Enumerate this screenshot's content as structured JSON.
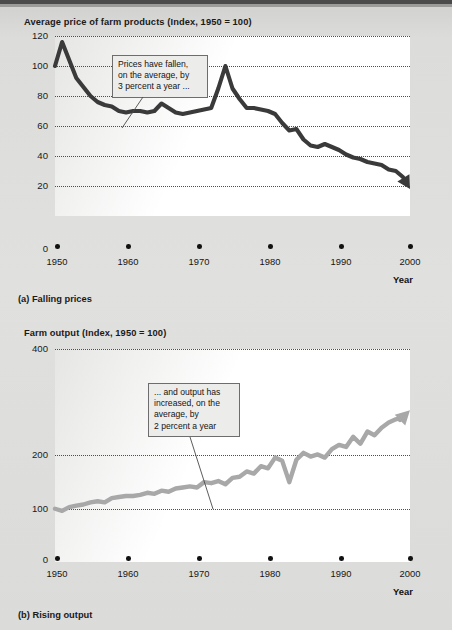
{
  "page": {
    "background_color": "#dcdcda",
    "figure_label": "Figure: Falling prices and rising output in U.S. agriculture"
  },
  "chart_a": {
    "title": "Average price of farm products (Index, 1950 = 100)",
    "caption": "(a) Falling prices",
    "x_axis_name": "Year",
    "callout_text": "Prices have fallen,\non the average, by\n3 percent a year ...",
    "line_color": "#3a3a3a",
    "y_ticks": [
      "120",
      "100",
      "80",
      "60",
      "40",
      "20",
      "0"
    ],
    "x_ticks": [
      "1950",
      "1960",
      "1970",
      "1980",
      "1990",
      "2000"
    ]
  },
  "chart_b": {
    "title": "Farm output (Index, 1950 = 100)",
    "caption": "(b) Rising output",
    "x_axis_name": "Year",
    "callout_text": "... and output has\nincreased, on the\naverage, by\n2 percent a year",
    "line_color": "#a8a8a8",
    "y_ticks": [
      "400",
      "200",
      "100",
      "0"
    ],
    "x_ticks": [
      "1950",
      "1960",
      "1970",
      "1980",
      "1990",
      "2000"
    ]
  },
  "chart_data": [
    {
      "type": "line",
      "title": "Average price of farm products (Index, 1950 = 100)",
      "subtitle": "(a) Falling prices",
      "xlabel": "Year",
      "ylabel": "Index, 1950 = 100",
      "xlim": [
        1950,
        2000
      ],
      "ylim": [
        0,
        120
      ],
      "ytick_values": [
        0,
        20,
        40,
        60,
        80,
        100,
        120
      ],
      "xtick_values": [
        1950,
        1960,
        1970,
        1980,
        1990,
        2000
      ],
      "grid": "horizontal-dotted",
      "legend": "none",
      "annotation": "Prices have fallen, on the average, by 3 percent a year ...",
      "series": [
        {
          "name": "Average price of farm products",
          "x": [
            1950,
            1951,
            1952,
            1953,
            1954,
            1955,
            1956,
            1957,
            1958,
            1959,
            1960,
            1961,
            1962,
            1963,
            1964,
            1965,
            1966,
            1967,
            1968,
            1969,
            1970,
            1971,
            1972,
            1973,
            1974,
            1975,
            1976,
            1977,
            1978,
            1979,
            1980,
            1981,
            1982,
            1983,
            1984,
            1985,
            1986,
            1987,
            1988,
            1989,
            1990,
            1991,
            1992,
            1993,
            1994,
            1995,
            1996,
            1997,
            1998,
            1999,
            2000
          ],
          "values": [
            100,
            116,
            104,
            92,
            86,
            80,
            76,
            74,
            73,
            70,
            69,
            70,
            70,
            69,
            70,
            75,
            72,
            69,
            68,
            69,
            70,
            71,
            72,
            85,
            100,
            85,
            78,
            72,
            72,
            71,
            70,
            68,
            62,
            57,
            58,
            51,
            47,
            46,
            48,
            46,
            44,
            41,
            39,
            38,
            36,
            35,
            34,
            31,
            30,
            26,
            18
          ]
        }
      ]
    },
    {
      "type": "line",
      "title": "Farm output (Index, 1950 = 100)",
      "subtitle": "(b) Rising output",
      "xlabel": "Year",
      "ylabel": "Index, 1950 = 100",
      "xlim": [
        1950,
        2000
      ],
      "ylim": [
        0,
        400
      ],
      "ytick_values": [
        0,
        100,
        200,
        400
      ],
      "xtick_values": [
        1950,
        1960,
        1970,
        1980,
        1990,
        2000
      ],
      "grid": "horizontal-dotted",
      "legend": "none",
      "annotation": "... and output has increased, on the average, by 2 percent a year",
      "series": [
        {
          "name": "Farm output",
          "x": [
            1950,
            1951,
            1952,
            1953,
            1954,
            1955,
            1956,
            1957,
            1958,
            1959,
            1960,
            1961,
            1962,
            1963,
            1964,
            1965,
            1966,
            1967,
            1968,
            1969,
            1970,
            1971,
            1972,
            1973,
            1974,
            1975,
            1976,
            1977,
            1978,
            1979,
            1980,
            1981,
            1982,
            1983,
            1984,
            1985,
            1986,
            1987,
            1988,
            1989,
            1990,
            1991,
            1992,
            1993,
            1994,
            1995,
            1996,
            1997,
            1998,
            1999,
            2000
          ],
          "values": [
            100,
            96,
            103,
            106,
            108,
            112,
            114,
            112,
            120,
            122,
            124,
            124,
            126,
            130,
            128,
            134,
            132,
            138,
            140,
            142,
            140,
            150,
            148,
            152,
            146,
            158,
            160,
            170,
            166,
            180,
            176,
            196,
            190,
            150,
            192,
            205,
            198,
            202,
            196,
            212,
            220,
            216,
            235,
            222,
            245,
            238,
            252,
            262,
            268,
            272,
            285
          ]
        }
      ]
    }
  ]
}
